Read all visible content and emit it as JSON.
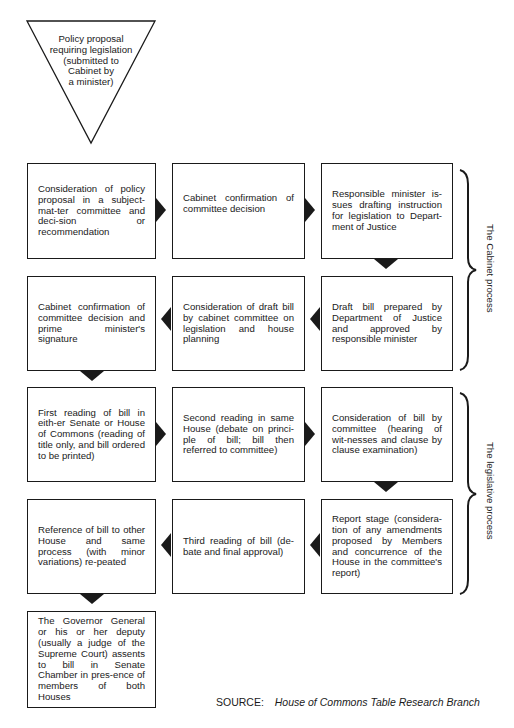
{
  "diagram": {
    "start": {
      "shape": "inverted-triangle",
      "text": "Policy proposal requiring legislation (submitted to Cabinet by a minister)",
      "lines": [
        "Policy proposal",
        "requiring legislation",
        "(submitted to",
        "Cabinet by",
        "a minister)"
      ]
    },
    "steps": [
      {
        "id": 1,
        "row": 1,
        "col": 1,
        "text": "Consideration of policy proposal in a subject-mat-ter committee and deci-sion or recommendation"
      },
      {
        "id": 2,
        "row": 1,
        "col": 2,
        "text": "Cabinet confirmation of committee decision"
      },
      {
        "id": 3,
        "row": 1,
        "col": 3,
        "text": "Responsible minister is-sues drafting instruction for legislation to Depart-ment of Justice"
      },
      {
        "id": 4,
        "row": 2,
        "col": 3,
        "text": "Draft bill prepared by Department of Justice and approved by responsible minister"
      },
      {
        "id": 5,
        "row": 2,
        "col": 2,
        "text": "Consideration of draft bill by cabinet committee on legislation and house planning"
      },
      {
        "id": 6,
        "row": 2,
        "col": 1,
        "text": "Cabinet confirmation of committee decision and prime minister's signature"
      },
      {
        "id": 7,
        "row": 3,
        "col": 1,
        "text": "First reading of bill in eith-er Senate or House of Commons (reading of title only, and bill ordered to be printed)"
      },
      {
        "id": 8,
        "row": 3,
        "col": 2,
        "text": "Second reading in same House (debate on princi-ple of bill; bill then referred to committee)"
      },
      {
        "id": 9,
        "row": 3,
        "col": 3,
        "text": "Consideration of bill by committee (hearing of wit-nesses and clause by clause examination)"
      },
      {
        "id": 10,
        "row": 4,
        "col": 3,
        "text": "Report stage (considera-tion of any amendments proposed by Members and concurrence of the House in the committee's report)"
      },
      {
        "id": 11,
        "row": 4,
        "col": 2,
        "text": "Third reading of bill (de-bate and final approval)"
      },
      {
        "id": 12,
        "row": 4,
        "col": 1,
        "text": "Reference of bill to other House and same process (with minor variations) re-peated"
      },
      {
        "id": 13,
        "row": 5,
        "col": 1,
        "text": "The Governor General or his or her deputy (usually a judge of the Supreme Court) assents to bill in Senate Chamber in pres-ence of members of both Houses"
      }
    ],
    "arrows": [
      {
        "from": 1,
        "to": 2,
        "direction": "right"
      },
      {
        "from": 2,
        "to": 3,
        "direction": "right"
      },
      {
        "from": 3,
        "to": 4,
        "direction": "down"
      },
      {
        "from": 4,
        "to": 5,
        "direction": "left"
      },
      {
        "from": 5,
        "to": 6,
        "direction": "left"
      },
      {
        "from": 6,
        "to": 7,
        "direction": "down"
      },
      {
        "from": 7,
        "to": 8,
        "direction": "right"
      },
      {
        "from": 8,
        "to": 9,
        "direction": "right"
      },
      {
        "from": 9,
        "to": 10,
        "direction": "down"
      },
      {
        "from": 10,
        "to": 11,
        "direction": "left"
      },
      {
        "from": 11,
        "to": 12,
        "direction": "left"
      },
      {
        "from": 12,
        "to": 13,
        "direction": "down"
      }
    ],
    "groups": [
      {
        "label": "The Cabinet process",
        "rows": [
          1,
          2
        ]
      },
      {
        "label": "The legislative process",
        "rows": [
          3,
          4
        ]
      }
    ],
    "source": {
      "label": "SOURCE:",
      "value": "House of Commons Table Research Branch"
    }
  },
  "colors": {
    "line": "#1a1a1a",
    "background": "#ffffff"
  }
}
